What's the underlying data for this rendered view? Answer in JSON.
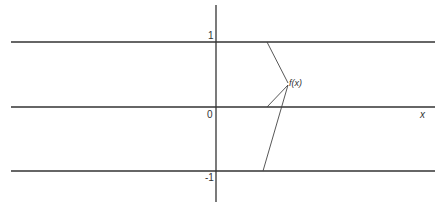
{
  "diagram": {
    "axis_labels": {
      "y_tick_1": "1",
      "y_tick_0": "0",
      "y_tick_neg1": "-1",
      "x_axis": "x"
    },
    "function_label": "f(x)",
    "colors": {
      "line": "#333333",
      "background": "#ffffff"
    },
    "horizontal_lines": [
      {
        "value": 1,
        "y": 42
      },
      {
        "value": 0,
        "y": 107
      },
      {
        "value": -1,
        "y": 171
      }
    ],
    "leader_points": [
      {
        "x": 267,
        "y": 42
      },
      {
        "x": 267,
        "y": 107
      },
      {
        "x": 263,
        "y": 171
      }
    ],
    "label_anchor": {
      "x": 288,
      "y": 83
    }
  }
}
